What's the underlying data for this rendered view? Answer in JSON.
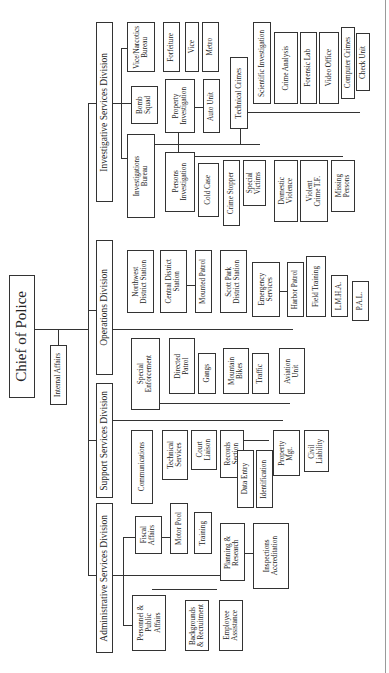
{
  "chart_title": "Chief of Police",
  "chief": {
    "label": "Chief of Police"
  },
  "staff": {
    "internal_affairs": "Internal Affairs"
  },
  "divisions": {
    "investigative": {
      "label": "Investigative Services Division",
      "vice_narcotics": {
        "label": "Vice/Narcotics\nBureau",
        "children": [
          "Forfeiture",
          "Vice",
          "Metro"
        ]
      },
      "bomb_squad": "Bomb\nSquad",
      "investigations_bureau": {
        "label": "Investigations\nBureau",
        "property_investigation": {
          "label": "Property\nInvestigation",
          "children": [
            "Auto Unit"
          ]
        },
        "technical_crimes": {
          "label": "Technical Crimes",
          "children": [
            "Scientific Investigation",
            "Crime Analysis",
            "Forensic Lab",
            "Video Office",
            "Computer Crimes",
            "Check Unit"
          ]
        },
        "persons_investigation": {
          "label": "Persons\nInvestigation",
          "children": [
            "Cold Case",
            "Crime Stopper",
            "Special\nVictims",
            "Domestic\nViolence",
            "Violent\nCrime T.F.",
            "Missing\nPersons"
          ]
        }
      }
    },
    "operations": {
      "label": "Operations Division",
      "children": [
        "Northwest\nDistrict Station",
        "Central District\nStation",
        "Mounted Patrol",
        "Scott Park\nDistrict Station",
        "Emergency\nServices",
        "Harbor Patrol",
        "Field Training",
        "L.M.H.A.",
        "P.A.L."
      ]
    },
    "support": {
      "label": "Support Services Division",
      "special_enforcement": {
        "label": "Special\nEnforcement",
        "children": [
          "Directed\nPatrol",
          "Gangs",
          "Mountain\nBikes",
          "Traffic",
          "Aviation\nUnit"
        ]
      },
      "children": [
        "Communications",
        "Technical\nServices",
        "Court\nLiaison",
        "Records\nSection",
        "Property\nMgt.",
        "Civil\nLiability"
      ],
      "records_children": [
        "Data Entry",
        "Identification"
      ]
    },
    "administrative": {
      "label": "Administrative Services Division",
      "children": [
        "Fiscal\nAffairs",
        "Motor Pool",
        "Training",
        "Planning &\nResearch",
        "Inspections\nAccreditation",
        "Personnel &\nPublic\nAffairs",
        "Backgrounds\n& Recruitment",
        "Employee\nAssistance"
      ]
    }
  }
}
